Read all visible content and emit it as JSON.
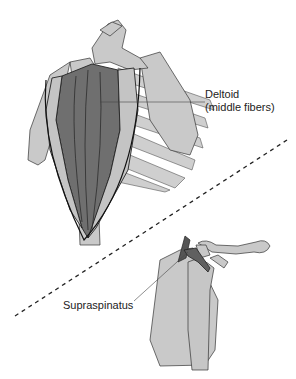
{
  "figure": {
    "top_panel": {
      "label_line1": "Deltoid",
      "label_line2": "(middle fibers)"
    },
    "bottom_panel": {
      "label": "Supraspinatus"
    },
    "colors": {
      "bone": "#c8c8c8",
      "muscle": "#707070",
      "outline": "#222222",
      "rib": "#cfcfcf"
    }
  }
}
